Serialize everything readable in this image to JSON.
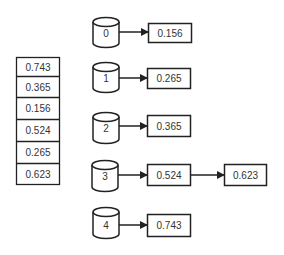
{
  "diagram": {
    "type": "bucket-sort",
    "colors": {
      "stroke": "#222222",
      "text": "#333333",
      "background": "#ffffff"
    },
    "input_array": {
      "values": [
        "0.743",
        "0.365",
        "0.156",
        "0.524",
        "0.265",
        "0.623"
      ]
    },
    "buckets": [
      {
        "label": "0",
        "items": [
          "0.156"
        ]
      },
      {
        "label": "1",
        "items": [
          "0.265"
        ]
      },
      {
        "label": "2",
        "items": [
          "0.365"
        ]
      },
      {
        "label": "3",
        "items": [
          "0.524",
          "0.623"
        ]
      },
      {
        "label": "4",
        "items": [
          "0.743"
        ]
      }
    ]
  }
}
